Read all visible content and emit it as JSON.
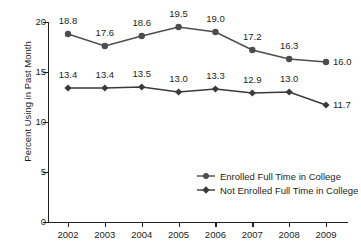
{
  "chart_data": {
    "type": "line",
    "title": "",
    "xlabel": "",
    "ylabel": "Percent Using in Past Month",
    "categories": [
      "2002",
      "2003",
      "2004",
      "2005",
      "2006",
      "2007",
      "2008",
      "2009"
    ],
    "ylim": [
      0,
      20
    ],
    "yticks": [
      "0",
      "5",
      "10",
      "15",
      "20"
    ],
    "ytick_values": [
      0,
      5,
      10,
      15,
      20
    ],
    "grid": false,
    "legend_position": "inside-lower-right",
    "series": [
      {
        "name": "Enrolled Full Time in College",
        "marker": "circle",
        "color": "#4d4d4d",
        "values": [
          18.8,
          17.6,
          18.6,
          19.5,
          19.0,
          17.2,
          16.3,
          16.0
        ],
        "labels": [
          "18.8",
          "17.6",
          "18.6",
          "19.5",
          "19.0",
          "17.2",
          "16.3",
          "16.0"
        ]
      },
      {
        "name": "Not Enrolled Full Time in College",
        "marker": "diamond",
        "color": "#3a3a3a",
        "values": [
          13.4,
          13.4,
          13.5,
          13.0,
          13.3,
          12.9,
          13.0,
          11.7
        ],
        "labels": [
          "13.4",
          "13.4",
          "13.5",
          "13.0",
          "13.3",
          "12.9",
          "13.0",
          "11.7"
        ]
      }
    ]
  }
}
